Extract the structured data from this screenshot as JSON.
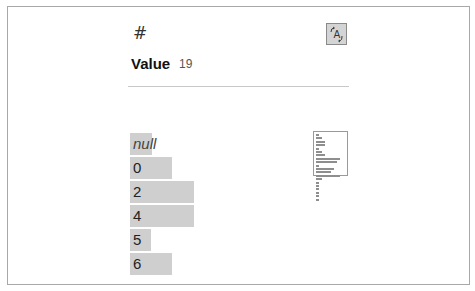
{
  "header": {
    "type_icon": "#",
    "type_icon_name": "number-type-icon",
    "sort_button_icon": "A",
    "sort_button_icon_name": "sort-toggle-icon"
  },
  "column": {
    "name": "Value",
    "count": "19"
  },
  "histogram": {
    "bar_color": "#cfcfcf",
    "items": [
      {
        "label": "null",
        "count": 1,
        "is_null": true
      },
      {
        "label": "0",
        "count": 2,
        "is_null": false
      },
      {
        "label": "2",
        "count": 3,
        "is_null": false
      },
      {
        "label": "4",
        "count": 3,
        "is_null": false
      },
      {
        "label": "5",
        "count": 1,
        "is_null": false
      },
      {
        "label": "6",
        "count": 2,
        "is_null": false
      }
    ]
  },
  "minimap": {
    "bar_widths": [
      3,
      6,
      9,
      9,
      3,
      6,
      9,
      24,
      21,
      3,
      18,
      15,
      24,
      6,
      3,
      3,
      3,
      3,
      3,
      3
    ],
    "viewport_rows": 13
  }
}
